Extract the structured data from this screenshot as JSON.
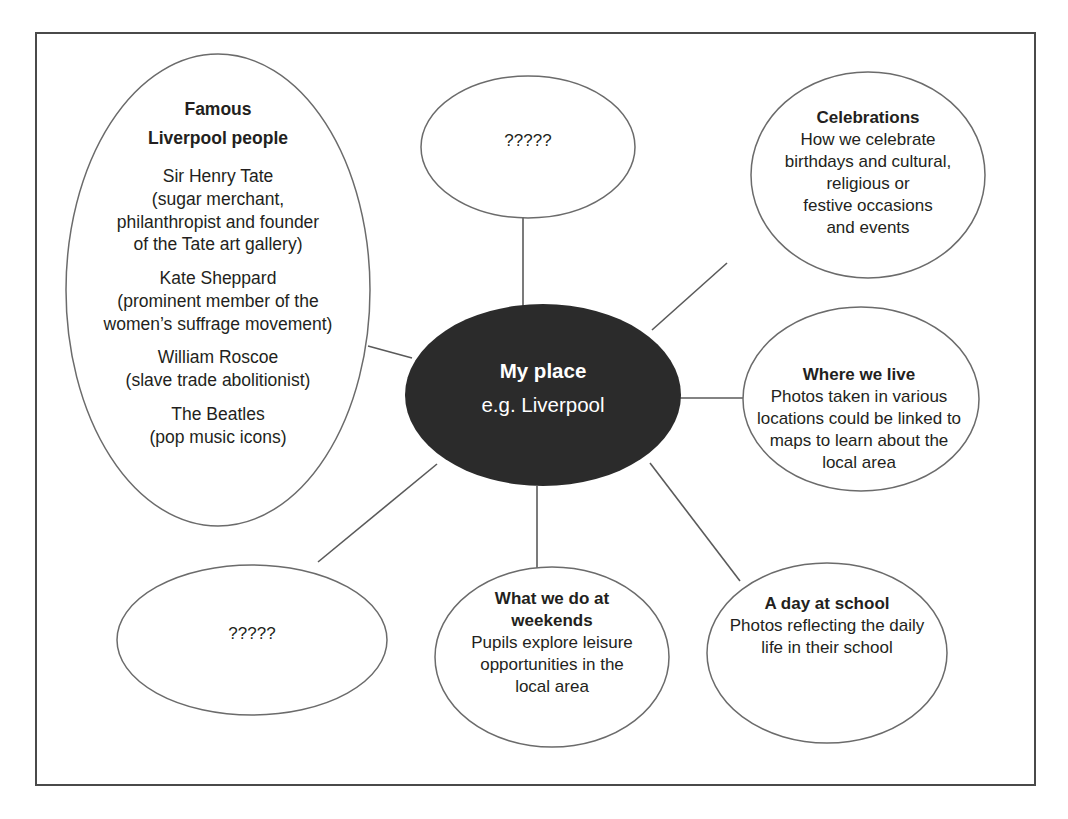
{
  "diagram": {
    "type": "mind-map",
    "frame": {
      "border_color": "#4a4a4a"
    },
    "center_node": {
      "title": "My place",
      "subtitle": "e.g. Liverpool",
      "fill_color": "#2b2b2b",
      "text_color": "#ffffff"
    },
    "nodes": [
      {
        "id": "famous-liverpool-people",
        "title_line1": "Famous",
        "title_line2": "Liverpool people",
        "entries": [
          {
            "name": "Sir Henry Tate",
            "detail_line1": "(sugar merchant,",
            "detail_line2": "philanthropist and founder",
            "detail_line3": "of the Tate art gallery)"
          },
          {
            "name": "Kate Sheppard",
            "detail_line1": "(prominent member of the",
            "detail_line2": "women’s suffrage movement)",
            "detail_line3": ""
          },
          {
            "name": "William Roscoe",
            "detail_line1": "(slave trade abolitionist)",
            "detail_line2": "",
            "detail_line3": ""
          },
          {
            "name": "The Beatles",
            "detail_line1": "(pop music icons)",
            "detail_line2": "",
            "detail_line3": ""
          }
        ]
      },
      {
        "id": "placeholder-top",
        "label": "?????"
      },
      {
        "id": "celebrations",
        "title": "Celebrations",
        "body_line1": "How we celebrate",
        "body_line2": "birthdays and cultural,",
        "body_line3": "religious or",
        "body_line4": "festive occasions",
        "body_line5": "and events"
      },
      {
        "id": "where-we-live",
        "title": "Where we live",
        "body_line1": "Photos taken in various",
        "body_line2": "locations could be linked to",
        "body_line3": "maps to learn about the",
        "body_line4": "local area"
      },
      {
        "id": "a-day-at-school",
        "title": "A day at school",
        "body_line1": "Photos reflecting the daily",
        "body_line2": "life in their school"
      },
      {
        "id": "what-we-do-at-weekends",
        "title_line1": "What we do at",
        "title_line2": "weekends",
        "body_line1": "Pupils explore leisure",
        "body_line2": "opportunities in the",
        "body_line3": "local area"
      },
      {
        "id": "placeholder-bottom",
        "label": "?????"
      }
    ]
  }
}
